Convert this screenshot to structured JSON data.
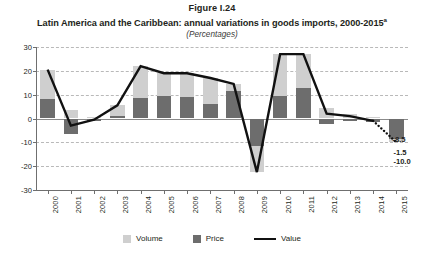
{
  "figure": {
    "number": "Figure I.24",
    "title": "Latin America and the Caribbean: annual variations in goods imports, 2000-2015",
    "title_footnote": "a",
    "subtitle": "(Percentages)"
  },
  "legend": {
    "position": "bottom-center",
    "items": [
      {
        "label": "Volume",
        "type": "swatch",
        "color": "#cfcfcf",
        "name": "volume"
      },
      {
        "label": "Price",
        "type": "swatch",
        "color": "#6d6d6d",
        "name": "price"
      },
      {
        "label": "Value",
        "type": "line",
        "color": "#111111",
        "name": "value"
      }
    ]
  },
  "chart_data": {
    "type": "bar",
    "title": "Latin America and the Caribbean: annual variations in goods imports, 2000-2015",
    "subtitle": "(Percentages)",
    "xlabel": "",
    "ylabel": "",
    "ylim": [
      -30,
      30
    ],
    "yticks": [
      30,
      20,
      10,
      0,
      -10,
      -20,
      -30
    ],
    "ytick_labels": [
      "30",
      "20",
      "10",
      "0",
      "-10",
      "-20",
      "-30"
    ],
    "grid": true,
    "stacked": true,
    "categories": [
      "2000",
      "2001",
      "2002",
      "2003",
      "2004",
      "2005",
      "2006",
      "2007",
      "2008",
      "2009",
      "2010",
      "2011",
      "2012",
      "2013",
      "2014",
      "2015"
    ],
    "series": [
      {
        "name": "Price",
        "color": "#6d6d6d",
        "values": [
          8.0,
          -6.5,
          -1.0,
          1.0,
          8.5,
          9.5,
          9.0,
          6.0,
          11.5,
          -11.5,
          9.5,
          13.0,
          -2.5,
          -1.0,
          -1.5,
          -8.5
        ]
      },
      {
        "name": "Volume",
        "color": "#cfcfcf",
        "values": [
          12.5,
          3.5,
          0.5,
          4.5,
          13.5,
          9.5,
          10.0,
          11.0,
          3.0,
          -11.0,
          17.5,
          14.0,
          4.5,
          2.0,
          0.5,
          -1.5
        ]
      }
    ],
    "line_series": {
      "name": "Value",
      "color": "#111111",
      "values": [
        20.5,
        -3.0,
        -0.5,
        5.5,
        22.0,
        19.0,
        19.0,
        17.0,
        14.5,
        -22.5,
        27.0,
        27.0,
        2.0,
        1.0,
        -1.0,
        -10.0
      ],
      "dashed_from": "2014"
    },
    "data_labels": [
      {
        "value": "-8.5",
        "series": "Price",
        "category": "2015"
      },
      {
        "value": "-1.5",
        "series": "Volume",
        "category": "2015"
      },
      {
        "value": "-10.0",
        "series": "Value",
        "category": "2015"
      }
    ]
  }
}
